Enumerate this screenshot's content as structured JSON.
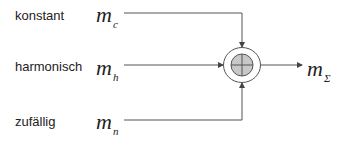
{
  "inputs": [
    {
      "label": "konstant",
      "symbol": "m",
      "subscript": "c"
    },
    {
      "label": "harmonisch",
      "symbol": "m",
      "subscript": "h"
    },
    {
      "label": "zufällig",
      "symbol": "m",
      "subscript": "n"
    }
  ],
  "output": {
    "symbol": "m",
    "subscript": "Σ"
  },
  "node": {
    "type": "summation",
    "fill": "#c8c8c8"
  },
  "colors": {
    "line": "#444444",
    "text": "#222222"
  }
}
